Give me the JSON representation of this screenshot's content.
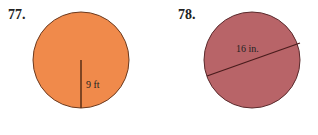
{
  "problems": [
    {
      "number": "77.",
      "label": "9 ft",
      "measure": "radius",
      "fill": "#f08a4b",
      "stroke": "#6b3a1f"
    },
    {
      "number": "78.",
      "label": "16 in.",
      "measure": "diameter",
      "fill": "#b86468",
      "stroke": "#5a2a2c"
    }
  ]
}
